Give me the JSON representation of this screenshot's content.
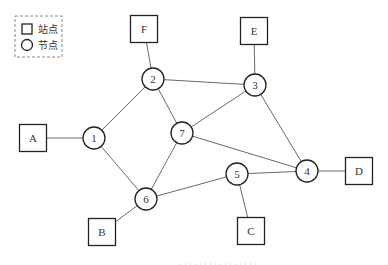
{
  "legend": {
    "items": [
      {
        "shape": "square",
        "label": "站点"
      },
      {
        "shape": "circle",
        "label": "节点"
      }
    ]
  },
  "nodes": [
    {
      "id": "1",
      "label": "1",
      "x": 94,
      "y": 138
    },
    {
      "id": "2",
      "label": "2",
      "x": 153,
      "y": 79
    },
    {
      "id": "3",
      "label": "3",
      "x": 255,
      "y": 85
    },
    {
      "id": "4",
      "label": "4",
      "x": 307,
      "y": 171
    },
    {
      "id": "5",
      "label": "5",
      "x": 237,
      "y": 174
    },
    {
      "id": "6",
      "label": "6",
      "x": 146,
      "y": 199
    },
    {
      "id": "7",
      "label": "7",
      "x": 182,
      "y": 133
    }
  ],
  "stations": [
    {
      "id": "A",
      "label": "A",
      "x": 33,
      "y": 138,
      "attached_to": "1"
    },
    {
      "id": "B",
      "label": "B",
      "x": 102,
      "y": 232,
      "attached_to": "6"
    },
    {
      "id": "C",
      "label": "C",
      "x": 251,
      "y": 231,
      "attached_to": "5"
    },
    {
      "id": "D",
      "label": "D",
      "x": 359,
      "y": 171,
      "attached_to": "4"
    },
    {
      "id": "E",
      "label": "E",
      "x": 254,
      "y": 31,
      "attached_to": "3"
    },
    {
      "id": "F",
      "label": "F",
      "x": 144,
      "y": 29,
      "attached_to": "2"
    }
  ],
  "edges": [
    [
      "1",
      "2"
    ],
    [
      "1",
      "6"
    ],
    [
      "2",
      "3"
    ],
    [
      "2",
      "7"
    ],
    [
      "3",
      "7"
    ],
    [
      "3",
      "4"
    ],
    [
      "7",
      "4"
    ],
    [
      "7",
      "6"
    ],
    [
      "6",
      "5"
    ],
    [
      "5",
      "4"
    ]
  ],
  "style": {
    "node_radius": 11,
    "station_size": 27
  }
}
